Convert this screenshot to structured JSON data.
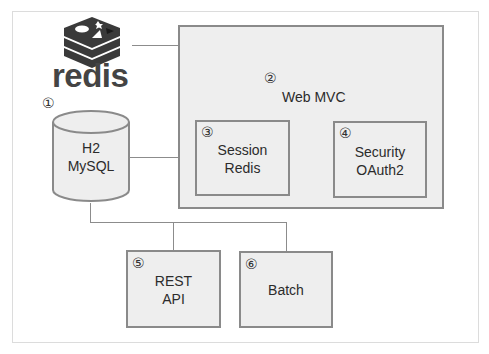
{
  "diagram": {
    "logo": {
      "icon": "redis-stack-icon",
      "text": "redis"
    },
    "database": {
      "number": "①",
      "lines": [
        "H2",
        "MySQL"
      ]
    },
    "web_mvc": {
      "number": "②",
      "label": "Web MVC",
      "children": [
        {
          "number": "③",
          "lines": [
            "Session",
            "Redis"
          ]
        },
        {
          "number": "④",
          "lines": [
            "Security",
            "OAuth2"
          ]
        }
      ]
    },
    "modules": [
      {
        "number": "⑤",
        "lines": [
          "REST",
          "API"
        ]
      },
      {
        "number": "⑥",
        "lines": [
          "Batch"
        ]
      }
    ],
    "colors": {
      "box_fill": "#eeeeee",
      "box_border": "#8a8a8a",
      "connector": "#8c8c8c",
      "logo": "#3a3a3a"
    },
    "connections": [
      {
        "from": "redis",
        "to": "session-redis"
      },
      {
        "from": "database",
        "to": "web-mvc"
      },
      {
        "from": "database",
        "to": "rest-api"
      },
      {
        "from": "database",
        "to": "batch"
      }
    ]
  }
}
